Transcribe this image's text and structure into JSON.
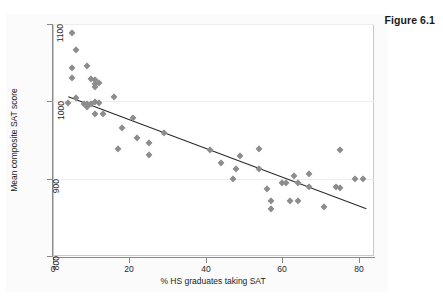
{
  "figure": {
    "title": "Figure 6.1"
  },
  "chart_data": {
    "type": "scatter",
    "title": "Figure 6.1",
    "xlabel": "% HS graduates taking SAT",
    "ylabel": "Mean composite SAT score",
    "xlim": [
      0,
      84
    ],
    "ylim": [
      800,
      1100
    ],
    "xticks": [
      0,
      20,
      40,
      60,
      80
    ],
    "yticks": [
      800,
      900,
      1000,
      1100
    ],
    "xtick_labels": [
      "0",
      "20",
      "40",
      "60",
      "80"
    ],
    "ytick_labels": [
      "800",
      "900",
      "1000",
      "1100"
    ],
    "grid": "horizontal",
    "legend": "none",
    "marker": "diamond",
    "marker_color": "#8d8d8d",
    "points": [
      {
        "x": 5,
        "y": 1089
      },
      {
        "x": 6,
        "y": 1067
      },
      {
        "x": 5,
        "y": 1043
      },
      {
        "x": 5,
        "y": 1030
      },
      {
        "x": 9,
        "y": 1046
      },
      {
        "x": 4,
        "y": 998
      },
      {
        "x": 6,
        "y": 1004
      },
      {
        "x": 10,
        "y": 1029
      },
      {
        "x": 11,
        "y": 1027
      },
      {
        "x": 11,
        "y": 1023
      },
      {
        "x": 12,
        "y": 1024
      },
      {
        "x": 11,
        "y": 1018
      },
      {
        "x": 8,
        "y": 997
      },
      {
        "x": 9,
        "y": 996
      },
      {
        "x": 9,
        "y": 993
      },
      {
        "x": 10,
        "y": 997
      },
      {
        "x": 11,
        "y": 999
      },
      {
        "x": 12,
        "y": 998
      },
      {
        "x": 11,
        "y": 983
      },
      {
        "x": 13,
        "y": 983
      },
      {
        "x": 16,
        "y": 1005
      },
      {
        "x": 21,
        "y": 979
      },
      {
        "x": 18,
        "y": 966
      },
      {
        "x": 22,
        "y": 952
      },
      {
        "x": 29,
        "y": 959
      },
      {
        "x": 25,
        "y": 946
      },
      {
        "x": 17,
        "y": 938
      },
      {
        "x": 25,
        "y": 931
      },
      {
        "x": 41,
        "y": 937
      },
      {
        "x": 44,
        "y": 920
      },
      {
        "x": 47,
        "y": 899
      },
      {
        "x": 49,
        "y": 929
      },
      {
        "x": 48,
        "y": 912
      },
      {
        "x": 54,
        "y": 938
      },
      {
        "x": 54,
        "y": 912
      },
      {
        "x": 56,
        "y": 886
      },
      {
        "x": 57,
        "y": 871
      },
      {
        "x": 57,
        "y": 861
      },
      {
        "x": 60,
        "y": 895
      },
      {
        "x": 61,
        "y": 894
      },
      {
        "x": 62,
        "y": 871
      },
      {
        "x": 63,
        "y": 904
      },
      {
        "x": 64,
        "y": 871
      },
      {
        "x": 64,
        "y": 894
      },
      {
        "x": 67,
        "y": 889
      },
      {
        "x": 67,
        "y": 906
      },
      {
        "x": 71,
        "y": 864
      },
      {
        "x": 74,
        "y": 889
      },
      {
        "x": 75,
        "y": 888
      },
      {
        "x": 75,
        "y": 937
      },
      {
        "x": 79,
        "y": 900
      },
      {
        "x": 81,
        "y": 900
      }
    ],
    "fit_line": {
      "label": "linear fit",
      "x1": 4,
      "y1": 1006,
      "x2": 82,
      "y2": 861,
      "color": "#2b2b2b"
    }
  }
}
